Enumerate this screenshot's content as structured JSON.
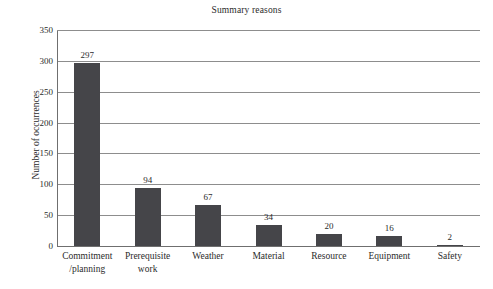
{
  "chart_data": {
    "type": "bar",
    "title": "Summary reasons",
    "xlabel": "",
    "ylabel": "Number of occurrences",
    "categories": [
      "Commitment\n/planning",
      "Prerequisite\nwork",
      "Weather",
      "Material",
      "Resource",
      "Equipment",
      "Safety"
    ],
    "category_lines": [
      [
        "Commitment",
        "/planning"
      ],
      [
        "Prerequisite",
        "work"
      ],
      [
        "Weather",
        ""
      ],
      [
        "Material",
        ""
      ],
      [
        "Resource",
        ""
      ],
      [
        "Equipment",
        ""
      ],
      [
        "Safety",
        ""
      ]
    ],
    "values": [
      297,
      94,
      67,
      34,
      20,
      16,
      2
    ],
    "value_labels": [
      "297",
      "94",
      "67",
      "34",
      "20",
      "16",
      "2"
    ],
    "ylim": [
      0,
      350
    ],
    "yticks": [
      0,
      50,
      100,
      150,
      200,
      250,
      300,
      350
    ],
    "ytick_labels": [
      "0",
      "50",
      "100",
      "150",
      "200",
      "250",
      "300",
      "350"
    ],
    "grid": true,
    "grid_axis": "y",
    "legend": false,
    "bar_color": "#454549",
    "grid_color": "#8d8d8d",
    "axis_color": "#6f6f6f",
    "text_color": "#2b2b2b",
    "background": "#ffffff"
  }
}
